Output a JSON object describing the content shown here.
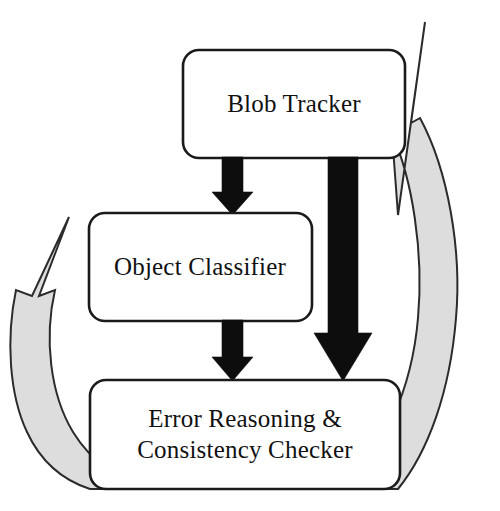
{
  "diagram": {
    "background_color": "#ffffff",
    "nodes": [
      {
        "id": "blob-tracker",
        "label": "Blob Tracker",
        "lines": [
          "Blob Tracker"
        ],
        "shape": "rounded-rectangle",
        "fill_color": "#ffffff",
        "border_color": "#1a1a1a",
        "x": 183,
        "y": 50,
        "width": 222,
        "height": 108
      },
      {
        "id": "object-classifier",
        "label": "Object Classifier",
        "lines": [
          "Object Classifier"
        ],
        "shape": "rounded-rectangle",
        "fill_color": "#ffffff",
        "border_color": "#1a1a1a",
        "x": 89,
        "y": 213,
        "width": 223,
        "height": 108
      },
      {
        "id": "error-reasoning-consistency-checker",
        "label": "Error Reasoning & Consistency Checker",
        "lines": [
          "Error Reasoning &",
          "Consistency Checker"
        ],
        "shape": "rounded-rectangle",
        "fill_color": "#ffffff",
        "border_color": "#1a1a1a",
        "x": 90,
        "y": 380,
        "width": 310,
        "height": 109
      }
    ],
    "edges": [
      {
        "id": "edge-blob-to-classifier",
        "from": "blob-tracker",
        "to": "object-classifier",
        "style": "solid-block-arrow",
        "color": "#0d0d0d",
        "direction": "down"
      },
      {
        "id": "edge-blob-to-error",
        "from": "blob-tracker",
        "to": "error-reasoning-consistency-checker",
        "style": "solid-block-arrow",
        "color": "#0d0d0d",
        "direction": "down"
      },
      {
        "id": "edge-classifier-to-error",
        "from": "object-classifier",
        "to": "error-reasoning-consistency-checker",
        "style": "solid-block-arrow",
        "color": "#0d0d0d",
        "direction": "down"
      },
      {
        "id": "edge-error-to-blob-feedback",
        "from": "error-reasoning-consistency-checker",
        "to": "blob-tracker",
        "style": "curved-feedback-arrow",
        "color": "#dddddd",
        "direction": "up",
        "side": "right"
      },
      {
        "id": "edge-error-to-classifier-feedback",
        "from": "error-reasoning-consistency-checker",
        "to": "object-classifier",
        "style": "curved-feedback-arrow",
        "color": "#dddddd",
        "direction": "up",
        "side": "left"
      }
    ],
    "colors": {
      "node_fill": "#ffffff",
      "node_border": "#1a1a1a",
      "forward_arrow": "#0d0d0d",
      "feedback_arrow_fill": "#dddddd",
      "feedback_arrow_stroke": "#2b2b2b",
      "text": "#111111"
    }
  }
}
